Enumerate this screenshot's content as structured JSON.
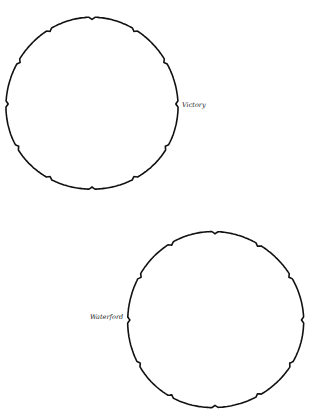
{
  "map": {
    "width": 310,
    "height": 411,
    "background": "#ffffff",
    "stroke_color": "#111111",
    "regions": [
      {
        "name": "Victory",
        "center": [
          92,
          104
        ],
        "radius": 86,
        "notches": 12,
        "label": "Victory",
        "label_position": [
          182,
          106
        ]
      },
      {
        "name": "Waterford",
        "center": [
          215,
          320
        ],
        "radius": 88,
        "notches": 12,
        "label": "Waterford",
        "label_position": [
          90,
          318
        ]
      }
    ]
  }
}
